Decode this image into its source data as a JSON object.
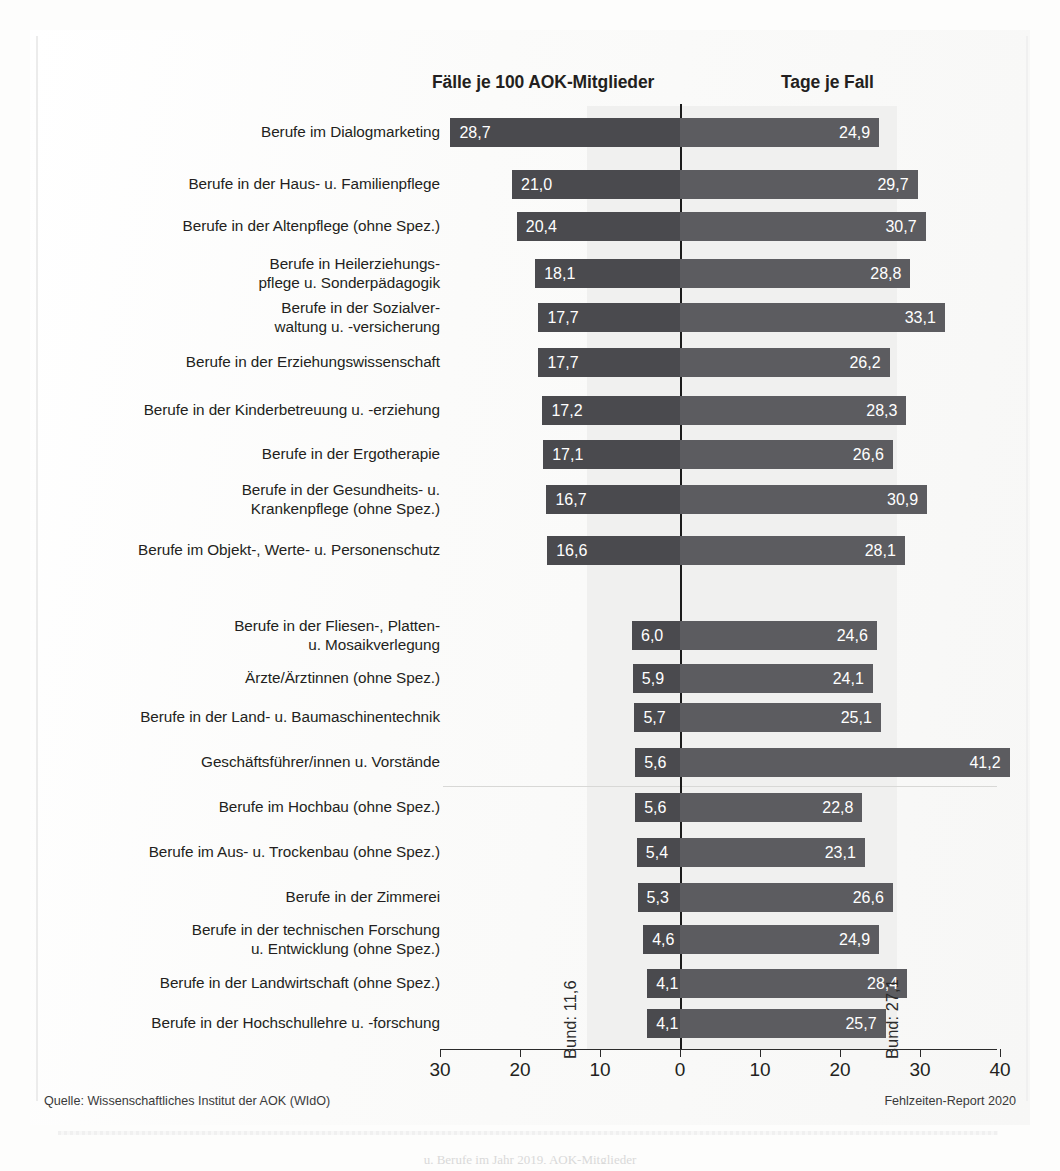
{
  "headers": {
    "left": "Fälle je 100 AOK-Mitglieder",
    "right": "Tage je Fall"
  },
  "axis": {
    "ticks": [
      "30",
      "20",
      "10",
      "0",
      "10",
      "20",
      "30",
      "40"
    ]
  },
  "reference": {
    "left_label": "Bund: 11,6",
    "right_label": "Bund: 27,1",
    "left_value": 11.6,
    "right_value": 27.1
  },
  "footer": {
    "source": "Quelle: Wissenschaftliches Institut der AOK (WIdO)",
    "report": "Fehlzeiten-Report 2020",
    "caption_cut": "u. Berufe im Jahr 2019, AOK-Mitglieder"
  },
  "colors": {
    "bar_left": "#4a4a4e",
    "bar_right": "#5c5c60",
    "band": "#f0f0ef",
    "axis": "#2b2b2b",
    "text": "#231f20",
    "value_text": "#ffffff"
  },
  "chart_data": {
    "type": "bar",
    "orientation": "horizontal-diverging",
    "title": "",
    "xlabel": "",
    "ylabel": "",
    "left_axis_label": "Fälle je 100 AOK-Mitglieder",
    "right_axis_label": "Tage je Fall",
    "left_xlim": [
      0,
      30
    ],
    "right_xlim": [
      0,
      40
    ],
    "xticks_left": [
      30,
      20,
      10,
      0
    ],
    "xticks_right": [
      10,
      20,
      30,
      40
    ],
    "grid": false,
    "legend": "none",
    "reference_lines": {
      "Bund Fälle je 100 AOK-Mitglieder": 11.6,
      "Bund Tage je Fall": 27.1
    },
    "categories": [
      "Berufe im Dialogmarketing",
      "Berufe in der Haus- u. Familienpflege",
      "Berufe in der Altenpflege (ohne Spez.)",
      "Berufe in Heilerziehungs-\npflege u. Sonderpädagogik",
      "Berufe in der Sozialver-\nwaltung u. -versicherung",
      "Berufe in der Erziehungswissenschaft",
      "Berufe in der Kinderbetreuung u. -erziehung",
      "Berufe in der Ergotherapie",
      "Berufe in der Gesundheits- u.\nKrankenpflege (ohne Spez.)",
      "Berufe im Objekt-, Werte- u. Personenschutz",
      "Berufe in der Fliesen-, Platten-\nu. Mosaikverlegung",
      "Ärzte/Ärztinnen (ohne Spez.)",
      "Berufe in der Land- u. Baumaschinentechnik",
      "Geschäftsführer/innen u. Vorstände",
      "Berufe im Hochbau (ohne Spez.)",
      "Berufe im Aus- u. Trockenbau (ohne Spez.)",
      "Berufe in der Zimmerei",
      "Berufe in der technischen Forschung\nu. Entwicklung (ohne Spez.)",
      "Berufe in der Landwirtschaft (ohne Spez.)",
      "Berufe in der Hochschullehre u. -forschung"
    ],
    "series": [
      {
        "name": "Fälle je 100 AOK-Mitglieder",
        "side": "left",
        "values": [
          28.7,
          21.0,
          20.4,
          18.1,
          17.7,
          17.7,
          17.2,
          17.1,
          16.7,
          16.6,
          6.0,
          5.9,
          5.7,
          5.6,
          5.6,
          5.4,
          5.3,
          4.6,
          4.1,
          4.1
        ],
        "labels": [
          "28,7",
          "21,0",
          "20,4",
          "18,1",
          "17,7",
          "17,7",
          "17,2",
          "17,1",
          "16,7",
          "16,6",
          "6,0",
          "5,9",
          "5,7",
          "5,6",
          "5,6",
          "5,4",
          "5,3",
          "4,6",
          "4,1",
          "4,1"
        ]
      },
      {
        "name": "Tage je Fall",
        "side": "right",
        "values": [
          24.9,
          29.7,
          30.7,
          28.8,
          33.1,
          26.2,
          28.3,
          26.6,
          30.9,
          28.1,
          24.6,
          24.1,
          25.1,
          41.2,
          22.8,
          23.1,
          26.6,
          24.9,
          28.4,
          25.7
        ],
        "labels": [
          "24,9",
          "29,7",
          "30,7",
          "28,8",
          "33,1",
          "26,2",
          "28,3",
          "26,6",
          "30,9",
          "28,1",
          "24,6",
          "24,1",
          "25,1",
          "41,2",
          "22,8",
          "23,1",
          "26,6",
          "24,9",
          "28,4",
          "25,7"
        ]
      }
    ],
    "row_tops": [
      118,
      170,
      212,
      259,
      303,
      348,
      396,
      440,
      485,
      536,
      621,
      664,
      703,
      748,
      793,
      838,
      883,
      925,
      969,
      1009
    ]
  }
}
